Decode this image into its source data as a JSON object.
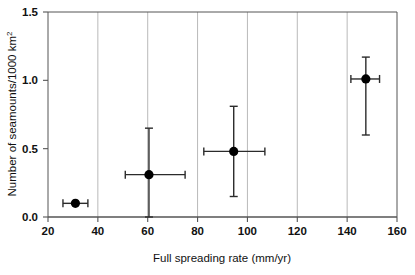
{
  "chart_data": {
    "type": "scatter",
    "title": "",
    "subtitle": "",
    "xlabel": "Full spreading rate (mm/yr)",
    "ylabel": "Number of seamounts/1000 km",
    "ylabel_superscript": "2",
    "xlim": [
      20,
      160
    ],
    "ylim": [
      0.0,
      1.5
    ],
    "xticks": [
      20,
      40,
      60,
      80,
      100,
      120,
      140,
      160
    ],
    "xtick_labels": [
      "20",
      "40",
      "60",
      "80",
      "100",
      "120",
      "140",
      "160"
    ],
    "yticks": [
      0.0,
      0.5,
      1.0,
      1.5
    ],
    "ytick_labels": [
      "0.0",
      "0.5",
      "1.0",
      "1.5"
    ],
    "grid": "vertical-only",
    "gridlines_x": [
      40,
      60,
      80,
      100,
      120,
      140
    ],
    "legend": "none",
    "marker": "filled-circle",
    "marker_color": "#000000",
    "errorbar_color": "#2b2b2b",
    "grid_color": "#b9b9b9",
    "axis_color": "#555555",
    "points": [
      {
        "x": 31,
        "y": 0.1,
        "x_err_low": 26,
        "x_err_high": 36,
        "y_err_low": 0.1,
        "y_err_high": 0.1
      },
      {
        "x": 60.5,
        "y": 0.31,
        "x_err_low": 51,
        "x_err_high": 75,
        "y_err_low": 0.0,
        "y_err_high": 0.65
      },
      {
        "x": 94.5,
        "y": 0.48,
        "x_err_low": 82.5,
        "x_err_high": 107,
        "y_err_low": 0.15,
        "y_err_high": 0.81
      },
      {
        "x": 147.5,
        "y": 1.01,
        "x_err_low": 141.5,
        "x_err_high": 153,
        "y_err_low": 0.6,
        "y_err_high": 1.17
      }
    ]
  }
}
